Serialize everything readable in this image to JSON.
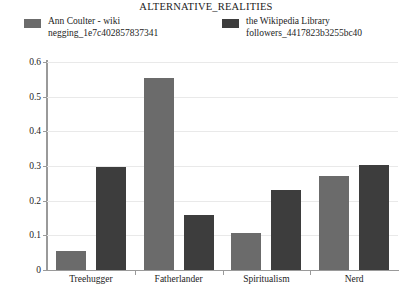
{
  "chart_data": {
    "type": "bar",
    "title": "ALTERNATIVE_REALITIES",
    "xlabel": "",
    "ylabel": "",
    "ylim": [
      0,
      0.6
    ],
    "yticks": [
      "0",
      "0.1",
      "0.2",
      "0.3",
      "0.4",
      "0.5",
      "0.6"
    ],
    "ytick_values": [
      0,
      0.1,
      0.2,
      0.3,
      0.4,
      0.5,
      0.6
    ],
    "grid": true,
    "legend_position": "top",
    "categories": [
      "Treehugger",
      "Fatherlander",
      "Spiritualism",
      "Nerd"
    ],
    "series": [
      {
        "name": "Ann Coulter - wiki negging_1e7c402857837341",
        "name_line1": "Ann Coulter - wiki",
        "name_line2": "negging_1e7c402857837341",
        "color": "#6b6b6b",
        "values": [
          0.055,
          0.555,
          0.108,
          0.272
        ]
      },
      {
        "name": "the Wikipedia Library followers_4417823b3255bc40",
        "name_line1": "the Wikipedia Library",
        "name_line2": "followers_4417823b3255bc40",
        "color": "#3d3d3d",
        "values": [
          0.296,
          0.16,
          0.23,
          0.302
        ]
      }
    ]
  },
  "colors": {
    "series_1": "#6b6b6b",
    "series_2": "#3d3d3d",
    "axis": "#9a9a9a",
    "grid": "#e9e9e9",
    "text": "#1c1c1c",
    "background": "#ffffff"
  }
}
